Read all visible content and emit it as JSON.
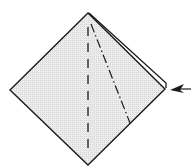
{
  "diagram": {
    "type": "origami-fold-step",
    "colors": {
      "paper_fill": "#e6e6e6",
      "stroke": "#1a1a1a",
      "background": "#ffffff"
    },
    "elements": [
      {
        "name": "square-paper-diamond",
        "kind": "polygon"
      },
      {
        "name": "valley-fold-line",
        "kind": "dashed-line"
      },
      {
        "name": "mountain-fold-line",
        "kind": "dash-dot-line"
      },
      {
        "name": "layered-edge",
        "kind": "double-edge"
      },
      {
        "name": "push-arrow",
        "kind": "arrow",
        "direction": "left"
      }
    ]
  }
}
